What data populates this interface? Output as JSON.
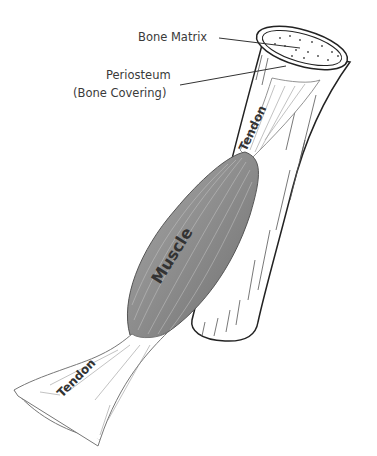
{
  "diagram": {
    "type": "anatomical illustration",
    "callouts": [
      {
        "id": "bone_matrix",
        "label": "Bone Matrix"
      },
      {
        "id": "periosteum",
        "label_line1": "Periosteum",
        "label_line2": "(Bone Covering)"
      }
    ],
    "inline_labels": {
      "upper_tendon": "Tendon",
      "muscle": "Muscle",
      "lower_tendon": "Tendon"
    },
    "colors": {
      "outline": "#222222",
      "muscle_fill": "#8a8a8a",
      "muscle_light": "#b5b5b5",
      "tendon_fill": "#ffffff",
      "bone_fill": "#ffffff",
      "leader_line": "#333333"
    }
  }
}
